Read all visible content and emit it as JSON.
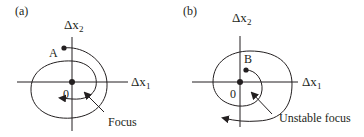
{
  "colors": {
    "ink": "#231f20",
    "background": "#ffffff"
  },
  "panels": [
    {
      "id": "a",
      "label": "(a)",
      "x_axis": {
        "symbol": "Δx",
        "sub": "1"
      },
      "y_axis": {
        "symbol": "Δx",
        "sub": "2"
      },
      "origin_label": "0",
      "start_point_label": "A",
      "annotation": "Focus",
      "behavior": "stable spiral converging inward to origin"
    },
    {
      "id": "b",
      "label": "(b)",
      "x_axis": {
        "symbol": "Δx",
        "sub": "1"
      },
      "y_axis": {
        "symbol": "Δx",
        "sub": "2"
      },
      "origin_label": "0",
      "start_point_label": "B",
      "annotation": "Unstable focus",
      "behavior": "unstable spiral diverging outward from origin"
    }
  ]
}
